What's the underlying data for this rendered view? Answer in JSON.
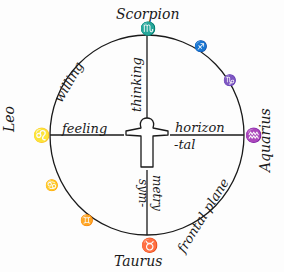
{
  "diagram": {
    "type": "zodiac-circle-with-human-figure",
    "colors": {
      "ink": "#1a1a1a",
      "paper": "#fdfdfd"
    },
    "signs": {
      "top": {
        "name": "Scorpion",
        "symbol": "♏"
      },
      "left": {
        "name": "Leo",
        "symbol": "♌"
      },
      "right": {
        "name": "Aquarius",
        "symbol": "♒"
      },
      "bottom": {
        "name": "Taurus",
        "symbol": "♉"
      },
      "sagittarius_symbol": "♐",
      "capricorn_symbol": "♑",
      "cancer_symbol": "♋",
      "gemini_symbol": "♊"
    },
    "axis_labels": {
      "up": "thinking",
      "left": "feeling",
      "right_line1": "horizon",
      "right_line2": "-tal",
      "down_line1": "sym-",
      "down_line2": "metry"
    },
    "arc_labels": {
      "upper_left": "willing",
      "lower_right": "frontal plane"
    }
  }
}
